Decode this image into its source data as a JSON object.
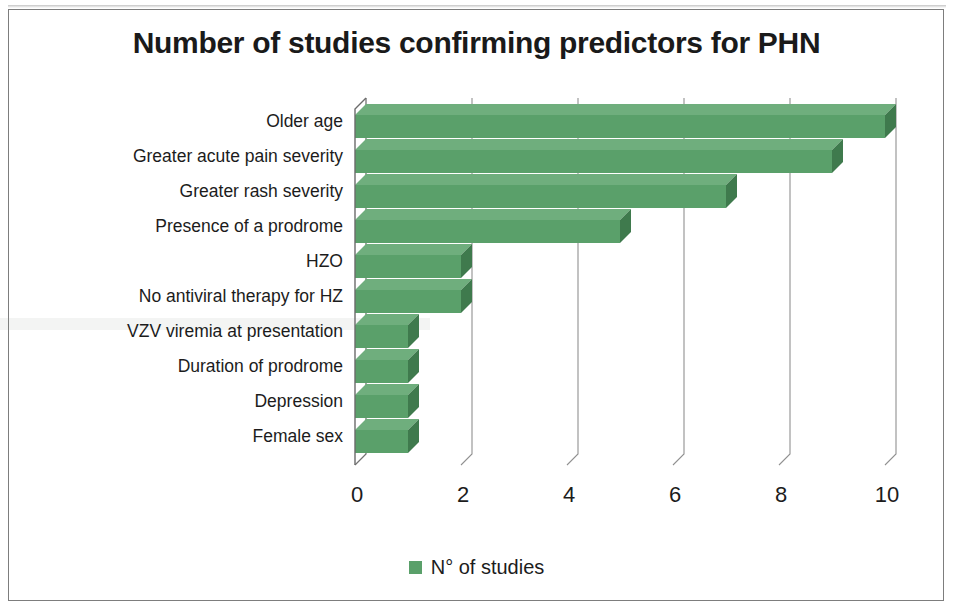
{
  "chart_data": {
    "type": "bar",
    "orientation": "horizontal",
    "title": "Number of studies confirming predictors for PHN",
    "xlabel": "",
    "ylabel": "",
    "categories": [
      "Older age",
      "Greater acute pain severity",
      "Greater rash severity",
      "Presence of a prodrome",
      "HZO",
      "No antiviral therapy for HZ",
      "VZV viremia at presentation",
      "Duration of prodrome",
      "Depression",
      "Female sex"
    ],
    "values": [
      10,
      9,
      7,
      5,
      2,
      2,
      1,
      1,
      1,
      1
    ],
    "series": [
      {
        "name": "N° of studies",
        "values": [
          10,
          9,
          7,
          5,
          2,
          2,
          1,
          1,
          1,
          1
        ],
        "color": "#5aa06a"
      }
    ],
    "xticks": [
      "0",
      "2",
      "4",
      "6",
      "8",
      "10"
    ],
    "xtick_values": [
      0,
      2,
      4,
      6,
      8,
      10
    ],
    "xlim": [
      0,
      10
    ],
    "grid": true,
    "grid_axis": "x",
    "legend": {
      "position": "bottom",
      "entries": [
        {
          "label": "N° of studies",
          "color": "#5aa06a"
        }
      ]
    },
    "style": {
      "three_d": true,
      "bar_color": "#5aa06a",
      "bar_shade_color": "#3f7a4d",
      "bar_top_color": "#6fae7d",
      "axis_color": "#6b6b6b",
      "text_color": "#1c1c1c",
      "background": "#ffffff",
      "border_color": "#7d7d7d"
    }
  },
  "legend": {
    "swatch_icon": "legend-color-swatch",
    "label": "N° of studies"
  },
  "frame": {
    "border_color": "#7d7d7d"
  }
}
